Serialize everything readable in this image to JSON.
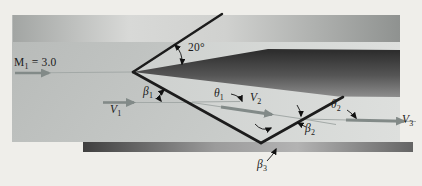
{
  "figure": {
    "labels": {
      "mach": {
        "base": "M",
        "sub": "1",
        "rest": " = 3.0"
      },
      "wedge_angle": {
        "text": "20°"
      },
      "v1": {
        "base": "V",
        "sub": "1"
      },
      "v2": {
        "base": "V",
        "sub": "2"
      },
      "v3": {
        "base": "V",
        "sub": "3"
      },
      "beta1": {
        "base": "β",
        "sub": "1"
      },
      "beta2": {
        "base": "β",
        "sub": "2"
      },
      "beta3": {
        "base": "β",
        "sub": "3"
      },
      "theta1": {
        "base": "θ",
        "sub": "1"
      },
      "theta2": {
        "base": "θ",
        "sub": "2"
      }
    },
    "colors": {
      "background": "#efeeea",
      "panel_left": "#b7bab8",
      "panel_right": "#cfd2d0",
      "downstream_left": "#cdd0ce",
      "downstream_right": "#dddfdd",
      "top_wall_left": "#a2a5a3",
      "top_wall_mid": "#d8d9d7",
      "top_wall_right": "#8f9290",
      "floor_left": "#3f3f3f",
      "floor_mid": "#b3b3b3",
      "floor_right": "#646464",
      "wedge_top": "#2e2e2e",
      "wedge_bottom": "#8d8d8d",
      "shock_line": "#1c1c1c",
      "flow_arrow": "#828a88",
      "streamline": "#a3a9a7",
      "annotation": "#111111",
      "label_text": "#1b1b1b"
    }
  }
}
